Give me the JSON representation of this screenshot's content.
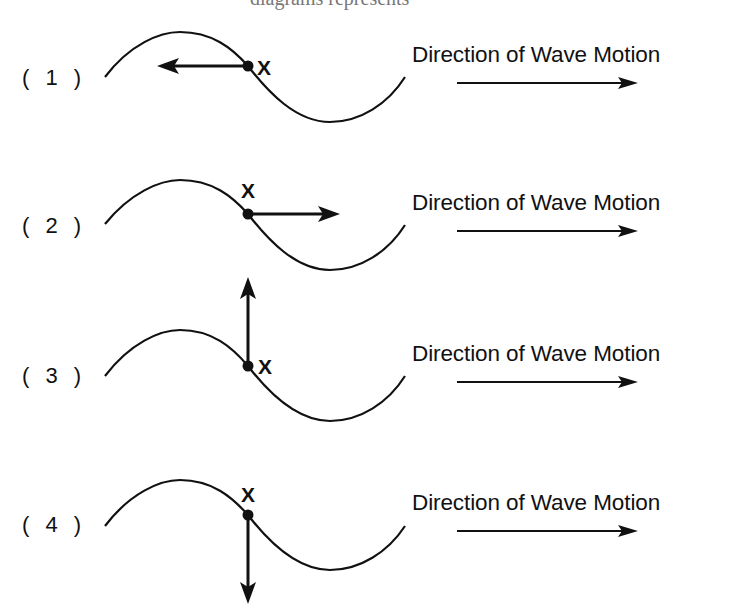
{
  "header": {
    "cut_off_text": "diagrams represents"
  },
  "direction_label": "Direction of Wave Motion",
  "point_label": "X",
  "options": [
    {
      "id": 1,
      "label": "( 1 )",
      "arrow_direction": "left",
      "x_label_position": "right-of-point"
    },
    {
      "id": 2,
      "label": "( 2 )",
      "arrow_direction": "right",
      "x_label_position": "above-point"
    },
    {
      "id": 3,
      "label": "( 3 )",
      "arrow_direction": "up",
      "x_label_position": "right-of-point"
    },
    {
      "id": 4,
      "label": "( 4 )",
      "arrow_direction": "down",
      "x_label_position": "above-point"
    }
  ],
  "colors": {
    "ink": "#111111",
    "background": "#ffffff"
  }
}
